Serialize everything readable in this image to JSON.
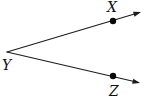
{
  "figure": {
    "type": "geometry-angle-diagram",
    "labels": {
      "x": "X",
      "y": "Y",
      "z": "Z"
    },
    "colors": {
      "line": "#1c1c1c",
      "dot": "#0a0a0a",
      "text": "#111111",
      "background": "#ffffff"
    }
  }
}
